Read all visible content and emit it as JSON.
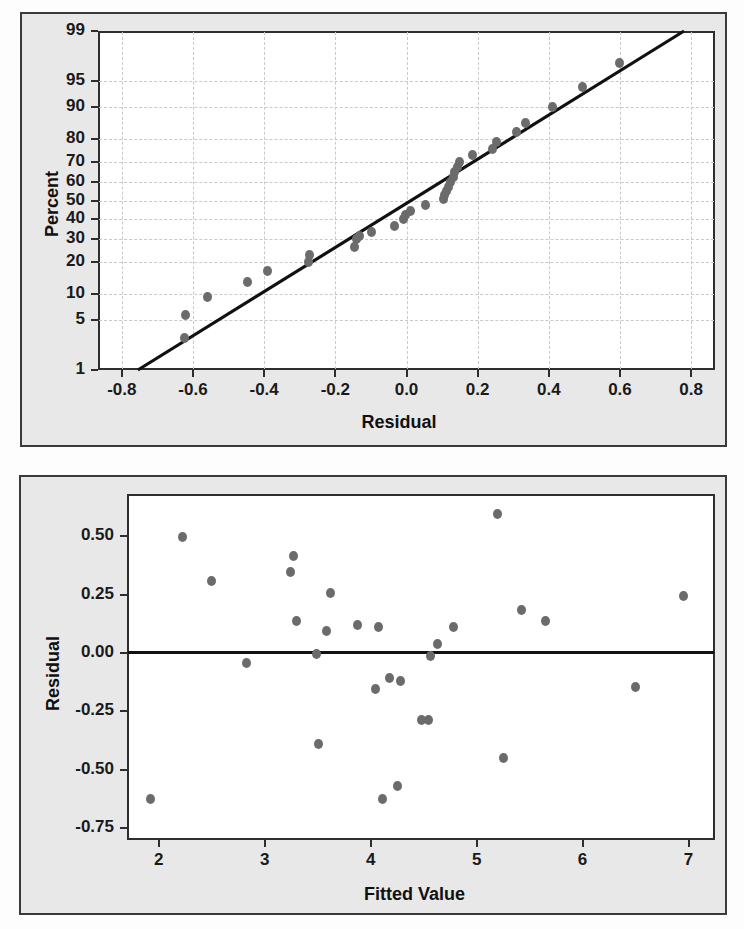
{
  "figure": {
    "panels": [
      "normal-probability-plot",
      "residuals-versus-fits-plot"
    ],
    "point_color": "#6b6b6b",
    "line_color": "#111111",
    "panel_background": "#e8e8e8",
    "plot_background": "#ffffff",
    "frame_color": "#2e2e2e"
  },
  "chart_data": [
    {
      "type": "scatter",
      "name": "normal-probability-plot",
      "title": "",
      "xlabel": "Residual",
      "ylabel": "Percent",
      "xlim": [
        -0.867,
        0.867
      ],
      "ylim": [
        1,
        99
      ],
      "yscale": "normal-probability",
      "grid": true,
      "legend": "none",
      "xticks": [
        -0.8,
        -0.6,
        -0.4,
        -0.2,
        0.0,
        0.2,
        0.4,
        0.6,
        0.8
      ],
      "xticklabels": [
        "-0.8",
        "-0.6",
        "-0.4",
        "-0.2",
        "0.0",
        "0.2",
        "0.4",
        "0.6",
        "0.8"
      ],
      "yticks": [
        1,
        5,
        10,
        20,
        30,
        40,
        50,
        60,
        70,
        80,
        90,
        95,
        99
      ],
      "yticklabels": [
        "1",
        "5",
        "10",
        "20",
        "30",
        "40",
        "50",
        "60",
        "70",
        "80",
        "90",
        "95",
        "99"
      ],
      "reference_line": {
        "x_start": -0.755,
        "y_start": 1,
        "x_end": 0.78,
        "y_end": 99
      },
      "points": [
        {
          "x": -0.625,
          "y": 3.0
        },
        {
          "x": -0.622,
          "y": 5.8
        },
        {
          "x": -0.558,
          "y": 9.3
        },
        {
          "x": -0.448,
          "y": 13.3
        },
        {
          "x": -0.39,
          "y": 16.5
        },
        {
          "x": -0.276,
          "y": 20.0
        },
        {
          "x": -0.273,
          "y": 22.8
        },
        {
          "x": -0.145,
          "y": 26.3
        },
        {
          "x": -0.14,
          "y": 29.8
        },
        {
          "x": -0.133,
          "y": 31.3
        },
        {
          "x": -0.097,
          "y": 33.2
        },
        {
          "x": -0.035,
          "y": 36.5
        },
        {
          "x": -0.008,
          "y": 40.0
        },
        {
          "x": -0.003,
          "y": 42.3
        },
        {
          "x": 0.012,
          "y": 44.5
        },
        {
          "x": 0.053,
          "y": 47.5
        },
        {
          "x": 0.105,
          "y": 51.0
        },
        {
          "x": 0.108,
          "y": 52.8
        },
        {
          "x": 0.112,
          "y": 55.0
        },
        {
          "x": 0.118,
          "y": 57.5
        },
        {
          "x": 0.125,
          "y": 60.0
        },
        {
          "x": 0.132,
          "y": 62.5
        },
        {
          "x": 0.136,
          "y": 65.0
        },
        {
          "x": 0.142,
          "y": 67.5
        },
        {
          "x": 0.148,
          "y": 70.0
        },
        {
          "x": 0.185,
          "y": 73.5
        },
        {
          "x": 0.243,
          "y": 76.0
        },
        {
          "x": 0.252,
          "y": 79.0
        },
        {
          "x": 0.31,
          "y": 82.5
        },
        {
          "x": 0.335,
          "y": 85.5
        },
        {
          "x": 0.41,
          "y": 90.0
        },
        {
          "x": 0.495,
          "y": 94.0
        },
        {
          "x": 0.598,
          "y": 97.0
        }
      ]
    },
    {
      "type": "scatter",
      "name": "residuals-versus-fits-plot",
      "title": "",
      "xlabel": "Fitted Value",
      "ylabel": "Residual",
      "xlim": [
        1.7,
        7.25
      ],
      "ylim": [
        -0.8,
        0.68
      ],
      "grid": false,
      "legend": "none",
      "xticks": [
        2,
        3,
        4,
        5,
        6,
        7
      ],
      "xticklabels": [
        "2",
        "3",
        "4",
        "5",
        "6",
        "7"
      ],
      "yticks": [
        0.5,
        0.25,
        0.0,
        -0.25,
        -0.5,
        -0.75
      ],
      "yticklabels": [
        "0.50",
        "0.25",
        "0.00",
        "-0.25",
        "-0.50",
        "-0.75"
      ],
      "reference_line": {
        "y": 0.0
      },
      "points": [
        {
          "x": 1.92,
          "y": -0.625
        },
        {
          "x": 2.22,
          "y": 0.495
        },
        {
          "x": 2.5,
          "y": 0.31
        },
        {
          "x": 2.83,
          "y": -0.045
        },
        {
          "x": 3.24,
          "y": 0.345
        },
        {
          "x": 3.27,
          "y": 0.415
        },
        {
          "x": 3.3,
          "y": 0.135
        },
        {
          "x": 3.49,
          "y": -0.005
        },
        {
          "x": 3.51,
          "y": -0.39
        },
        {
          "x": 3.58,
          "y": 0.095
        },
        {
          "x": 3.62,
          "y": 0.258
        },
        {
          "x": 3.88,
          "y": 0.118
        },
        {
          "x": 4.05,
          "y": -0.152
        },
        {
          "x": 4.07,
          "y": 0.11
        },
        {
          "x": 4.11,
          "y": -0.625
        },
        {
          "x": 4.18,
          "y": -0.105
        },
        {
          "x": 4.25,
          "y": -0.57
        },
        {
          "x": 4.28,
          "y": -0.118
        },
        {
          "x": 4.48,
          "y": -0.288
        },
        {
          "x": 4.55,
          "y": -0.285
        },
        {
          "x": 4.56,
          "y": -0.015
        },
        {
          "x": 4.63,
          "y": 0.04
        },
        {
          "x": 4.78,
          "y": 0.112
        },
        {
          "x": 5.2,
          "y": 0.595
        },
        {
          "x": 5.25,
          "y": -0.45
        },
        {
          "x": 5.42,
          "y": 0.182
        },
        {
          "x": 5.65,
          "y": 0.138
        },
        {
          "x": 6.5,
          "y": -0.145
        },
        {
          "x": 6.95,
          "y": 0.242
        }
      ]
    }
  ]
}
